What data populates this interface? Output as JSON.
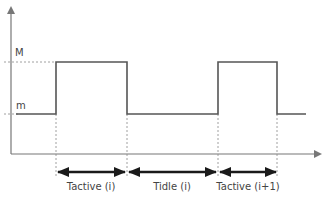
{
  "diagram": {
    "levels": {
      "high": "M",
      "low": "m"
    },
    "intervals": [
      {
        "label": "Tactive (i)"
      },
      {
        "label": "Tidle (i)"
      },
      {
        "label": "Tactive (i+1)"
      }
    ],
    "colors": {
      "signal": "#555555",
      "axis": "#777777",
      "arrow": "#1a1a1a",
      "dashed": "#888888"
    }
  }
}
